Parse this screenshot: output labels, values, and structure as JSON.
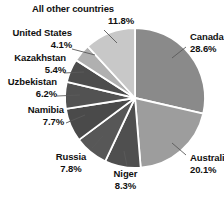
{
  "chart_data": {
    "type": "pie",
    "title": "",
    "categories": [
      "Canada",
      "Australia",
      "Niger",
      "Russia",
      "Namibia",
      "Uzbekistan",
      "Kazakhstan",
      "United States",
      "All other countries"
    ],
    "values": [
      28.6,
      20.1,
      8.3,
      7.8,
      7.7,
      6.2,
      5.4,
      4.1,
      11.8
    ],
    "value_labels": [
      "28.6%",
      "20.1%",
      "8.3%",
      "7.8%",
      "7.7%",
      "6.2%",
      "5.4%",
      "4.1%",
      "11.8%"
    ],
    "unit": "%",
    "legend": "none",
    "grid": false,
    "slice_colors": [
      "#8a8a8a",
      "#9d9d9d",
      "#4f4f4f",
      "#575757",
      "#4a4a4a",
      "#525252",
      "#4d4d4d",
      "#b0b0b0",
      "#c8c8c8"
    ],
    "separator_color": "#ffffff",
    "leader_line_color": "#5a5a5a",
    "background": "#ffffff",
    "text_color": "#111111"
  },
  "labels": {
    "all_other": {
      "name": "All other countries",
      "pct": "11.8%"
    },
    "united_states": {
      "name": "United States",
      "pct": "4.1%"
    },
    "kazakhstan": {
      "name": "Kazakhstan",
      "pct": "5.4%"
    },
    "uzbekistan": {
      "name": "Uzbekistan",
      "pct": "6.2%"
    },
    "namibia": {
      "name": "Namibia",
      "pct": "7.7%"
    },
    "russia": {
      "name": "Russia",
      "pct": "7.8%"
    },
    "niger": {
      "name": "Niger",
      "pct": "8.3%"
    },
    "australia": {
      "name": "Australia",
      "pct": "20.1%"
    },
    "canada": {
      "name": "Canada",
      "pct": "28.6%"
    }
  }
}
